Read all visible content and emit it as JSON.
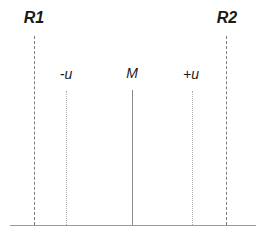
{
  "figure": {
    "title": "",
    "background_color": "#ffffff",
    "width": 265,
    "height": 241
  },
  "chart_data": {
    "type": "line",
    "title": "",
    "xlabel": "",
    "ylabel": "",
    "grid": false,
    "legend": null,
    "baseline": {
      "label": "axis-baseline",
      "x_start": 10,
      "x_end": 256,
      "y": 225,
      "color": "#9a9a9a"
    },
    "markers": [
      {
        "id": "R1",
        "label": "R1",
        "x": 34,
        "line_style": "dashed",
        "line_top": 36,
        "label_x": 34,
        "label_y": 10,
        "label_size": "outer",
        "color": "#7d7d7d"
      },
      {
        "id": "minus-u",
        "label": "-u",
        "x": 66,
        "line_style": "dotted",
        "line_top": 91,
        "label_x": 66,
        "label_y": 67,
        "label_size": "inner",
        "color": "#b0b0b0"
      },
      {
        "id": "M",
        "label": "M",
        "x": 132,
        "line_style": "solid",
        "line_top": 90,
        "label_x": 132,
        "label_y": 66,
        "label_size": "inner",
        "color": "#8a8a8a"
      },
      {
        "id": "plus-u",
        "label": "+u",
        "x": 192,
        "line_style": "dotted",
        "line_top": 91,
        "label_x": 191,
        "label_y": 67,
        "label_size": "inner",
        "color": "#b0b0b0"
      },
      {
        "id": "R2",
        "label": "R2",
        "x": 226,
        "line_style": "dashed",
        "line_top": 36,
        "label_x": 227,
        "label_y": 10,
        "label_size": "outer",
        "color": "#7d7d7d"
      }
    ]
  }
}
